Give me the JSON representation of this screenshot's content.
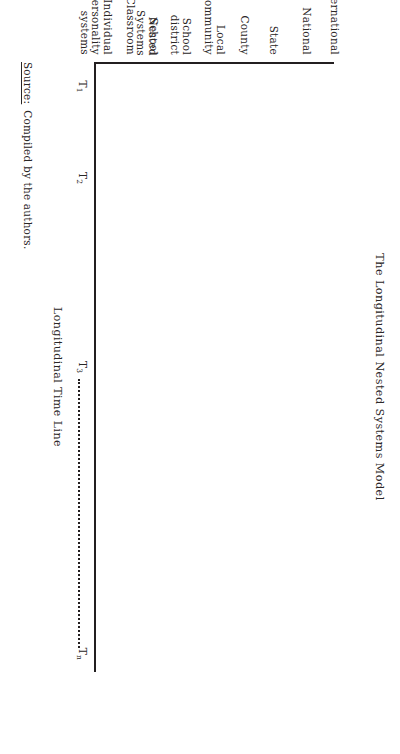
{
  "figure": {
    "title": "The Longitudinal Nested Systems Model",
    "orientation": "rotated-90-clockwise"
  },
  "y_axis": {
    "title": "Nested\nSystems",
    "labels": [
      {
        "text": "International",
        "pos": 2
      },
      {
        "text": "National",
        "pos": 14
      },
      {
        "text": "State",
        "pos": 28
      },
      {
        "text": "County",
        "pos": 40
      },
      {
        "text": "Local\ncommunity",
        "pos": 50
      },
      {
        "text": "School\ndistrict",
        "pos": 64
      },
      {
        "text": "School",
        "pos": 78
      },
      {
        "text": "Classroom",
        "pos": 88
      },
      {
        "text": "Individual\npersonality\nsystems",
        "pos": 97
      }
    ]
  },
  "x_axis": {
    "title": "Longitudinal Time Line",
    "ticks": [
      {
        "base": "T",
        "sub": "1",
        "pos": 4
      },
      {
        "base": "T",
        "sub": "2",
        "pos": 19
      },
      {
        "base": "T",
        "sub": "3",
        "pos": 50
      },
      {
        "base": "T",
        "sub": "n",
        "pos": 97
      }
    ],
    "dotted_segment": {
      "from": 52,
      "to": 96
    }
  },
  "source": {
    "label": "Source:",
    "text": "Compiled by the authors."
  },
  "colors": {
    "ink": "#231f20",
    "text": "#2a2626",
    "background": "#ffffff"
  }
}
